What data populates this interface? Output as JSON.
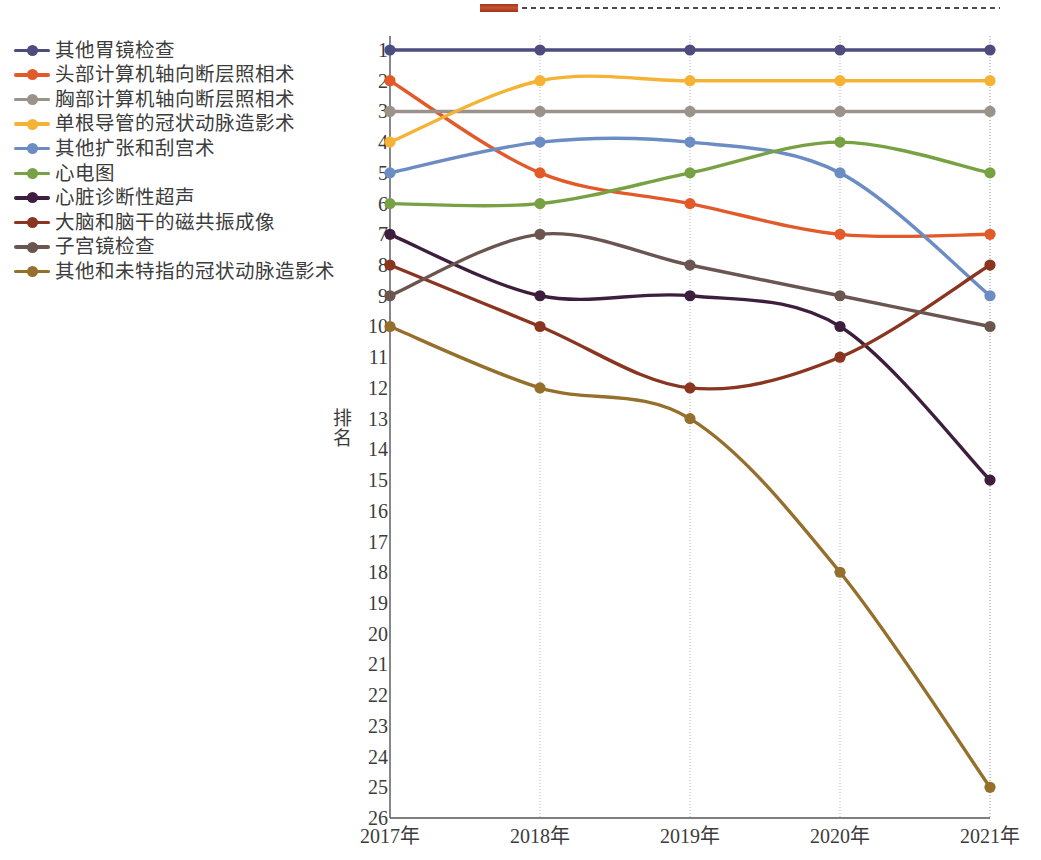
{
  "chart_data": {
    "type": "line",
    "title": "",
    "xlabel": "",
    "ylabel": "排名",
    "categories": [
      "2017年",
      "2018年",
      "2019年",
      "2020年",
      "2021年"
    ],
    "ylim": [
      1,
      26
    ],
    "y_inverted": true,
    "yticks": [
      1,
      2,
      3,
      4,
      5,
      6,
      7,
      8,
      9,
      10,
      11,
      12,
      13,
      14,
      15,
      16,
      17,
      18,
      19,
      20,
      21,
      22,
      23,
      24,
      25,
      26
    ],
    "grid": "vertical-only",
    "legend_position": "left-outside",
    "series": [
      {
        "name": "其他胃镜检查",
        "color": "#4c4c7f",
        "values": [
          1,
          1,
          1,
          1,
          1
        ]
      },
      {
        "name": "头部计算机轴向断层照相术",
        "color": "#e2592a",
        "values": [
          2,
          5,
          6,
          7,
          7
        ]
      },
      {
        "name": "胸部计算机轴向断层照相术",
        "color": "#9a928b",
        "values": [
          3,
          3,
          3,
          3,
          3
        ]
      },
      {
        "name": "单根导管的冠状动脉造影术",
        "color": "#f5b335",
        "values": [
          4,
          2,
          2,
          2,
          2
        ]
      },
      {
        "name": "其他扩张和刮宫术",
        "color": "#6c8cc4",
        "values": [
          5,
          4,
          4,
          5,
          9
        ]
      },
      {
        "name": "心电图",
        "color": "#77a142",
        "values": [
          6,
          6,
          5,
          4,
          5
        ]
      },
      {
        "name": "心脏诊断性超声",
        "color": "#3d1f3d",
        "values": [
          7,
          9,
          9,
          10,
          15
        ]
      },
      {
        "name": "大脑和脑干的磁共振成像",
        "color": "#8a3520",
        "values": [
          8,
          10,
          12,
          11,
          8
        ]
      },
      {
        "name": "子宫镜检查",
        "color": "#6b5550",
        "values": [
          9,
          7,
          8,
          9,
          10
        ]
      },
      {
        "name": "其他和未特指的冠状动脉造影术",
        "color": "#94702c",
        "values": [
          10,
          12,
          13,
          18,
          25
        ]
      }
    ]
  },
  "top_artifact": {
    "swatch_color": "#b8432a",
    "dashed_line_color": "#4b4b4b"
  },
  "bottom_cut_text": ""
}
